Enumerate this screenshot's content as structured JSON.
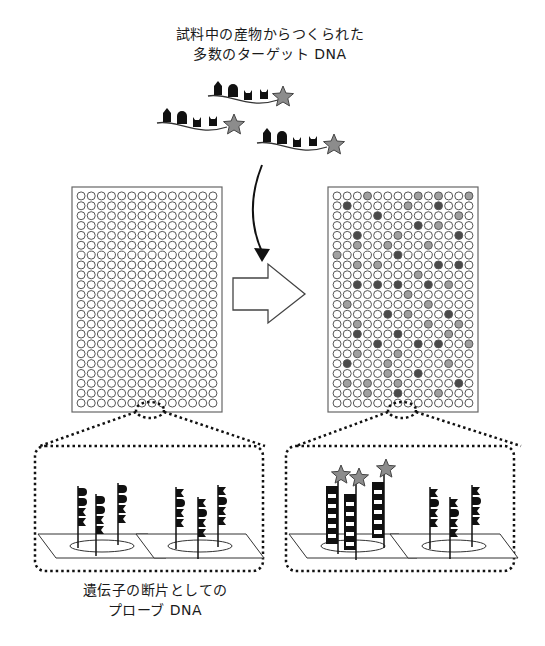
{
  "top_caption": {
    "line1": "試料中の産物からつくられた",
    "line2": "多数のターゲット DNA"
  },
  "bottom_caption": {
    "line1": "遺伝子の断片としての",
    "line2": "プローブ DNA"
  },
  "grid": {
    "rows": 22,
    "cols": 14,
    "left_chip": {
      "x": 72,
      "y": 187,
      "w": 150,
      "h": 225
    },
    "right_chip": {
      "x": 328,
      "y": 187,
      "w": 150,
      "h": 225
    }
  },
  "colors": {
    "dark_spot": "#4a4a4a",
    "light_spot": "#a0a0a0",
    "star": "#8c8c8c",
    "ink": "#111111"
  },
  "right_chip_spots": {
    "dark": [
      [
        1,
        1
      ],
      [
        1,
        10
      ],
      [
        2,
        4
      ],
      [
        3,
        8
      ],
      [
        4,
        2
      ],
      [
        4,
        12
      ],
      [
        6,
        6
      ],
      [
        7,
        10
      ],
      [
        7,
        12
      ],
      [
        9,
        2
      ],
      [
        9,
        4
      ],
      [
        9,
        6
      ],
      [
        9,
        9
      ],
      [
        12,
        5
      ],
      [
        12,
        11
      ],
      [
        14,
        2
      ],
      [
        14,
        6
      ],
      [
        15,
        4
      ],
      [
        15,
        8
      ],
      [
        15,
        10
      ],
      [
        17,
        1
      ],
      [
        18,
        8
      ],
      [
        19,
        12
      ],
      [
        20,
        6
      ]
    ],
    "light": [
      [
        0,
        3
      ],
      [
        0,
        8
      ],
      [
        0,
        10
      ],
      [
        0,
        13
      ],
      [
        1,
        7
      ],
      [
        2,
        12
      ],
      [
        3,
        10
      ],
      [
        4,
        6
      ],
      [
        5,
        2
      ],
      [
        5,
        5
      ],
      [
        5,
        9
      ],
      [
        6,
        0
      ],
      [
        7,
        2
      ],
      [
        7,
        4
      ],
      [
        8,
        8
      ],
      [
        9,
        11
      ],
      [
        10,
        7
      ],
      [
        11,
        1
      ],
      [
        11,
        9
      ],
      [
        12,
        7
      ],
      [
        13,
        2
      ],
      [
        13,
        9
      ],
      [
        13,
        12
      ],
      [
        14,
        11
      ],
      [
        15,
        13
      ],
      [
        16,
        2
      ],
      [
        16,
        6
      ],
      [
        17,
        5
      ],
      [
        17,
        11
      ],
      [
        18,
        5
      ],
      [
        19,
        1
      ],
      [
        19,
        3
      ],
      [
        19,
        6
      ],
      [
        20,
        3
      ],
      [
        20,
        10
      ]
    ]
  },
  "arrows": {
    "curved": "hybridization-arrow",
    "hollow": "process-arrow"
  }
}
